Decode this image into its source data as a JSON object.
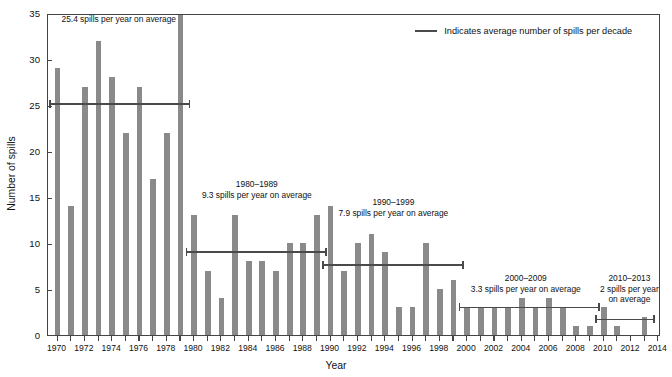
{
  "chart_data": {
    "type": "bar",
    "title": "",
    "xlabel": "Year",
    "ylabel": "Number of spills",
    "xlim": [
      1969.3,
      2014.2
    ],
    "ylim": [
      0,
      35
    ],
    "yticks": [
      0,
      5,
      10,
      15,
      20,
      25,
      30,
      35
    ],
    "xticks": [
      1970,
      1972,
      1974,
      1976,
      1978,
      1980,
      1982,
      1984,
      1986,
      1988,
      1990,
      1992,
      1994,
      1996,
      1998,
      2000,
      2002,
      2004,
      2006,
      2008,
      2010,
      2012,
      2014
    ],
    "grid": false,
    "bar_color": "#8a8a8a",
    "line_color": "#4a4a4a",
    "categories": [
      1970,
      1971,
      1972,
      1973,
      1974,
      1975,
      1976,
      1977,
      1978,
      1979,
      1980,
      1981,
      1982,
      1983,
      1984,
      1985,
      1986,
      1987,
      1988,
      1989,
      1990,
      1991,
      1992,
      1993,
      1994,
      1995,
      1996,
      1997,
      1998,
      1999,
      2000,
      2001,
      2002,
      2003,
      2004,
      2005,
      2006,
      2007,
      2008,
      2009,
      2010,
      2011,
      2012,
      2013
    ],
    "values": [
      29,
      14,
      27,
      32,
      28,
      22,
      27,
      17,
      22,
      36,
      13,
      7,
      4,
      13,
      8,
      8,
      7,
      10,
      10,
      13,
      14,
      7,
      10,
      11,
      9,
      3,
      3,
      10,
      5,
      6,
      3,
      3,
      3,
      3,
      4,
      3,
      4,
      3,
      1,
      1,
      3,
      1,
      0,
      2
    ],
    "decade_averages": [
      {
        "label": "1970–1979",
        "note": "25.4 spills per year on average",
        "value": 25.4,
        "start": 1970,
        "end": 1979
      },
      {
        "label": "1980–1989",
        "note": "9.3 spills per year on average",
        "value": 9.3,
        "start": 1980,
        "end": 1989
      },
      {
        "label": "1990–1999",
        "note": "7.9 spills per year on average",
        "value": 7.9,
        "start": 1990,
        "end": 1999
      },
      {
        "label": "2000–2009",
        "note": "3.3 spills per year on average",
        "value": 3.3,
        "start": 2000,
        "end": 2009
      },
      {
        "label": "2010–2013",
        "note": "2 spills per year on average",
        "value": 2.0,
        "start": 2010,
        "end": 2013
      }
    ],
    "legend": {
      "position": "top-right",
      "entries": [
        {
          "label": "Indicates average number of spills per decade",
          "marker": "line",
          "color": "#4a4a4a"
        }
      ]
    },
    "annotations": [
      {
        "label": "1970–1979",
        "note": "25.4 spills per year on average"
      },
      {
        "label": "1980–1989",
        "note": "9.3 spills per year on average"
      },
      {
        "label": "1990–1999",
        "note": "7.9 spills per year on average"
      },
      {
        "label": "2000–2009",
        "note": "3.3 spills per year on average"
      },
      {
        "label": "2010–2013",
        "note": "2 spills per year\non average"
      }
    ]
  }
}
